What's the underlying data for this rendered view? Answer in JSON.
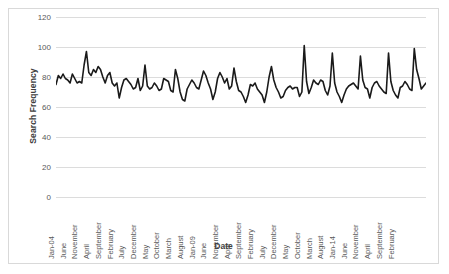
{
  "chart_data": {
    "type": "line",
    "title": "",
    "xlabel": "Date",
    "ylabel": "Search Frequency",
    "ylim": [
      0,
      120
    ],
    "yticks": [
      0,
      20,
      40,
      60,
      80,
      100,
      120
    ],
    "grid": true,
    "legend": "none",
    "line_color": "#1a1a1a",
    "x_tick_labels": [
      "Jan-04",
      "June",
      "November",
      "April",
      "September",
      "February",
      "July",
      "December",
      "May",
      "October",
      "March",
      "August",
      "Jan-09",
      "June",
      "November",
      "April",
      "September",
      "February",
      "July",
      "December",
      "May",
      "October",
      "March",
      "August",
      "Jan-14",
      "June",
      "November",
      "April",
      "September",
      "February"
    ],
    "x_tick_interval_months": 5,
    "x_start": "Jan-04",
    "x_end": "Feb-16",
    "series": [
      {
        "name": "Search Frequency",
        "values": [
          75,
          81,
          79,
          82,
          79,
          78,
          76,
          82,
          79,
          76,
          77,
          76,
          88,
          97,
          83,
          81,
          85,
          83,
          87,
          85,
          80,
          76,
          81,
          83,
          76,
          74,
          76,
          66,
          73,
          78,
          79,
          77,
          75,
          72,
          73,
          79,
          71,
          74,
          88,
          74,
          72,
          73,
          76,
          74,
          71,
          72,
          79,
          78,
          77,
          71,
          70,
          85,
          79,
          70,
          65,
          64,
          72,
          75,
          78,
          76,
          73,
          72,
          78,
          84,
          81,
          76,
          72,
          65,
          70,
          79,
          83,
          80,
          76,
          79,
          72,
          74,
          86,
          77,
          71,
          70,
          67,
          63,
          68,
          75,
          74,
          76,
          72,
          70,
          68,
          63,
          70,
          80,
          87,
          78,
          73,
          70,
          66,
          67,
          71,
          73,
          74,
          72,
          73,
          73,
          67,
          70,
          101,
          77,
          69,
          73,
          78,
          76,
          75,
          78,
          77,
          71,
          68,
          74,
          96,
          76,
          70,
          67,
          63,
          68,
          72,
          74,
          75,
          76,
          74,
          72,
          94,
          78,
          73,
          72,
          66,
          73,
          76,
          77,
          74,
          72,
          70,
          69,
          96,
          77,
          71,
          68,
          66,
          73,
          74,
          77,
          75,
          72,
          71,
          99,
          85,
          79,
          72,
          74,
          76
        ]
      }
    ]
  }
}
